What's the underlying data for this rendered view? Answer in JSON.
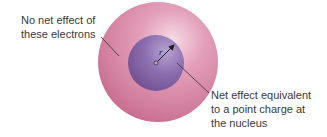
{
  "diagram": {
    "labels": {
      "outer_shell": {
        "lines": [
          "No net effect of",
          "these electrons"
        ]
      },
      "inner_sphere": {
        "lines": [
          "Net effect equivalent",
          "to a point charge at",
          "the nucleus"
        ]
      },
      "radius": "r"
    },
    "colors": {
      "outer_shell_edge": "#c7688c",
      "outer_shell_center": "#ecb3c8",
      "inner_sphere_edge": "#6e4a8c",
      "inner_sphere_highlight": "#b7a3d2",
      "leader_line": "#2e2e2e",
      "text": "#3a3a3a"
    },
    "geometry": {
      "outer_shell": {
        "cx": 158,
        "cy": 62,
        "r": 60
      },
      "inner_sphere": {
        "cx": 156,
        "cy": 63,
        "r": 28
      },
      "nucleus": {
        "cx": 156,
        "cy": 63
      }
    }
  }
}
